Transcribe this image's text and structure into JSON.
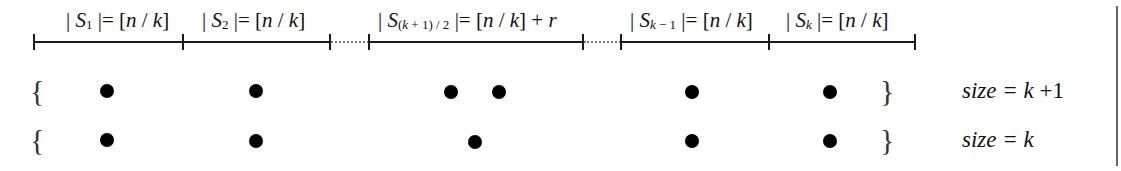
{
  "diagram": {
    "segments": [
      {
        "label_pre": "| ",
        "set": "S",
        "sub": "1",
        "label_post": " |= [n / k]",
        "x_start": 34,
        "x_end": 183,
        "style": "solid"
      },
      {
        "label_pre": "| ",
        "set": "S",
        "sub": "2",
        "label_post": " |= [n / k]",
        "x_start": 183,
        "x_end": 330,
        "style": "solid"
      },
      {
        "label_pre": "| ",
        "set": "S",
        "sub": "(k + 1) / 2",
        "label_post": " |= [n / k] + r",
        "x_start": 369,
        "x_end": 583,
        "style": "solid"
      },
      {
        "label_pre": "| ",
        "set": "S",
        "sub": "k − 1",
        "label_post": " |= [n / k]",
        "x_start": 621,
        "x_end": 769,
        "style": "solid"
      },
      {
        "label_pre": "| ",
        "set": "S",
        "sub": "k",
        "label_post": " |= [n / k]",
        "x_start": 769,
        "x_end": 915,
        "style": "solid"
      }
    ],
    "gaps": [
      {
        "x_start": 330,
        "x_end": 369,
        "style": "dotted"
      },
      {
        "x_start": 583,
        "x_end": 621,
        "style": "dotted"
      }
    ],
    "rows": [
      {
        "open_brace": "{",
        "close_brace": "}",
        "size_label": "size = k + 1",
        "dot_count": 7
      },
      {
        "open_brace": "{",
        "close_brace": "}",
        "size_label": "size = k",
        "dot_count": 6
      }
    ]
  }
}
